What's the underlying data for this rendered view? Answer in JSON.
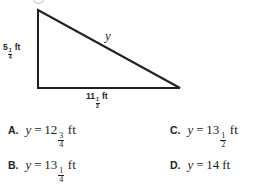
{
  "figure": {
    "shape": "right-triangle",
    "vertices": {
      "top_left": [
        38,
        10
      ],
      "bottom_left": [
        38,
        88
      ],
      "bottom_right": [
        180,
        88
      ]
    },
    "stroke_color": "#231f20",
    "leg_label": {
      "whole": "5",
      "numerator": "1",
      "denominator": "4",
      "unit": "ft"
    },
    "base_label": {
      "whole": "11",
      "numerator": "1",
      "denominator": "2",
      "unit": "ft"
    },
    "hypotenuse_label": "y"
  },
  "choices": [
    {
      "letter": "A.",
      "variable": "y",
      "equals": "=",
      "whole": "12",
      "numerator": "3",
      "denominator": "4",
      "unit": "ft"
    },
    {
      "letter": "B.",
      "variable": "y",
      "equals": "=",
      "whole": "13",
      "numerator": "1",
      "denominator": "4",
      "unit": "ft"
    },
    {
      "letter": "C.",
      "variable": "y",
      "equals": "=",
      "whole": "13",
      "numerator": "1",
      "denominator": "2",
      "unit": "ft"
    },
    {
      "letter": "D.",
      "variable": "y",
      "equals": "=",
      "whole": "14",
      "numerator": "",
      "denominator": "",
      "unit": "ft"
    }
  ]
}
